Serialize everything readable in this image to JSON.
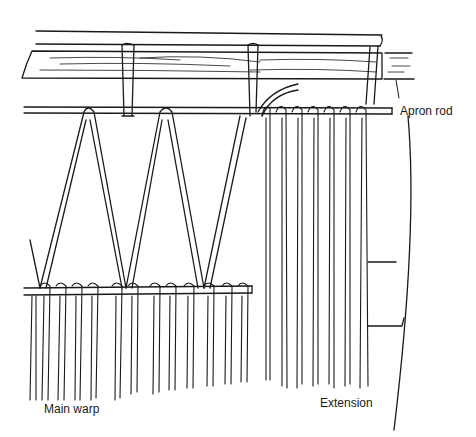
{
  "figure": {
    "type": "line-art illustration"
  },
  "labels": {
    "apron_rod": "Apron rod",
    "main_warp": "Main warp",
    "extension": "Extension"
  },
  "colors": {
    "ink": "#1a1a1a",
    "background": "#ffffff"
  }
}
